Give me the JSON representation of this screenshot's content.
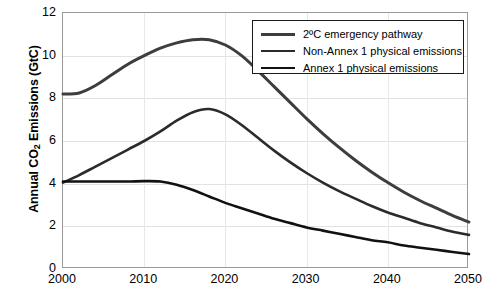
{
  "chart_data": {
    "type": "line",
    "title": "",
    "xlabel": "",
    "ylabel": "Annual CO2 Emissions (GtC)",
    "ylabel_main": "Annual CO",
    "ylabel_sub": "2",
    "ylabel_tail": " Emissions (GtC)",
    "xlim": [
      2000,
      2050
    ],
    "ylim": [
      0,
      12
    ],
    "xticks": [
      "2000",
      "2010",
      "2020",
      "2030",
      "2040",
      "2050"
    ],
    "yticks": [
      "0",
      "2",
      "4",
      "6",
      "8",
      "10",
      "12"
    ],
    "grid": true,
    "legend_position": "top-right",
    "x": [
      2000,
      2002,
      2004,
      2006,
      2008,
      2010,
      2012,
      2014,
      2016,
      2018,
      2020,
      2022,
      2024,
      2026,
      2028,
      2030,
      2032,
      2034,
      2036,
      2038,
      2040,
      2042,
      2044,
      2046,
      2048,
      2050
    ],
    "series": [
      {
        "name": "2ºC emergency pathway",
        "color": "#3d3d3d",
        "width": 3.0,
        "values": [
          8.2,
          8.25,
          8.6,
          9.1,
          9.6,
          10.0,
          10.35,
          10.6,
          10.75,
          10.75,
          10.5,
          10.0,
          9.3,
          8.55,
          7.8,
          7.05,
          6.35,
          5.7,
          5.1,
          4.55,
          4.05,
          3.6,
          3.2,
          2.85,
          2.5,
          2.2
        ]
      },
      {
        "name": "Non-Annex 1 physical emissions",
        "color": "#2b2b2b",
        "width": 2.6,
        "values": [
          4.05,
          4.4,
          4.8,
          5.2,
          5.6,
          6.0,
          6.45,
          6.95,
          7.35,
          7.5,
          7.25,
          6.75,
          6.15,
          5.55,
          5.0,
          4.5,
          4.05,
          3.65,
          3.3,
          2.95,
          2.65,
          2.4,
          2.15,
          1.95,
          1.75,
          1.6
        ]
      },
      {
        "name": "Annex 1 physical emissions",
        "color": "#111111",
        "width": 2.6,
        "values": [
          4.1,
          4.1,
          4.1,
          4.1,
          4.1,
          4.12,
          4.1,
          3.95,
          3.7,
          3.4,
          3.1,
          2.85,
          2.6,
          2.35,
          2.15,
          1.95,
          1.8,
          1.65,
          1.5,
          1.35,
          1.25,
          1.1,
          1.0,
          0.9,
          0.8,
          0.7
        ]
      }
    ]
  }
}
